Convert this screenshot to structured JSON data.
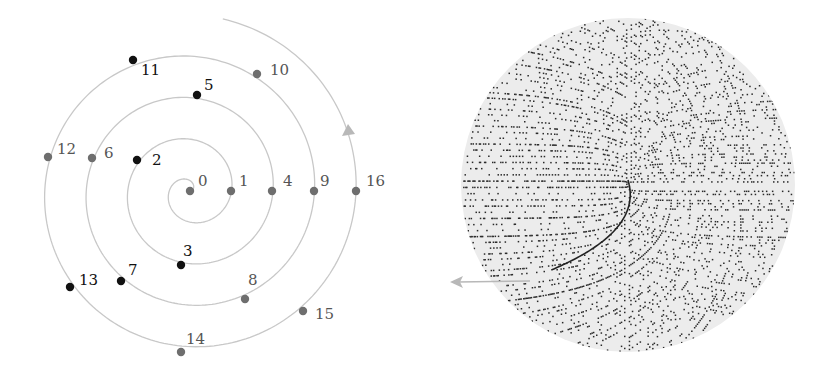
{
  "colors": {
    "background": "#ffffff",
    "spiral_line": "#c8c8c8",
    "prime_dot": "#111111",
    "composite_dot": "#6e6e6e",
    "label": "#333333",
    "arrow": "#b8b8b8",
    "disc_fill": "#ececec",
    "disc_dots": "#2a2a2a"
  },
  "left_panel": {
    "description": "Archimedean spiral with integers 0-16 placed at angle 2π√n, radius ∝ √n; primes shown as black dots",
    "center": [
      190,
      191
    ],
    "unit_radius": 41.5,
    "points": [
      {
        "n": 0,
        "label": "0",
        "prime": false,
        "x": 190,
        "y": 191,
        "lx": 198,
        "ly": 186
      },
      {
        "n": 1,
        "label": "1",
        "prime": false,
        "x": 231,
        "y": 191,
        "lx": 239,
        "ly": 186
      },
      {
        "n": 2,
        "label": "2",
        "prime": true,
        "x": 137,
        "y": 160,
        "lx": 152,
        "ly": 165
      },
      {
        "n": 3,
        "label": "3",
        "prime": true,
        "x": 181,
        "y": 265,
        "lx": 183,
        "ly": 256
      },
      {
        "n": 4,
        "label": "4",
        "prime": false,
        "x": 272,
        "y": 191,
        "lx": 283,
        "ly": 186
      },
      {
        "n": 5,
        "label": "5",
        "prime": true,
        "x": 197,
        "y": 95,
        "lx": 204,
        "ly": 90
      },
      {
        "n": 6,
        "label": "6",
        "prime": false,
        "x": 92,
        "y": 158,
        "lx": 104,
        "ly": 158
      },
      {
        "n": 7,
        "label": "7",
        "prime": true,
        "x": 121,
        "y": 281,
        "lx": 128,
        "ly": 275
      },
      {
        "n": 8,
        "label": "8",
        "prime": false,
        "x": 245,
        "y": 299,
        "lx": 248,
        "ly": 285
      },
      {
        "n": 9,
        "label": "9",
        "prime": false,
        "x": 314,
        "y": 191,
        "lx": 320,
        "ly": 186
      },
      {
        "n": 10,
        "label": "10",
        "prime": false,
        "x": 257,
        "y": 74,
        "lx": 270,
        "ly": 75
      },
      {
        "n": 11,
        "label": "11",
        "prime": true,
        "x": 133,
        "y": 60,
        "lx": 141,
        "ly": 75
      },
      {
        "n": 12,
        "label": "12",
        "prime": false,
        "x": 48,
        "y": 157,
        "lx": 57,
        "ly": 154
      },
      {
        "n": 13,
        "label": "13",
        "prime": true,
        "x": 70,
        "y": 287,
        "lx": 79,
        "ly": 285
      },
      {
        "n": 14,
        "label": "14",
        "prime": false,
        "x": 181,
        "y": 352,
        "lx": 186,
        "ly": 344
      },
      {
        "n": 15,
        "label": "15",
        "prime": false,
        "x": 303,
        "y": 311,
        "lx": 315,
        "ly": 319
      },
      {
        "n": 16,
        "label": "16",
        "prime": false,
        "x": 356,
        "y": 191,
        "lx": 366,
        "ly": 186
      }
    ],
    "arrow": {
      "from": [
        356,
        191
      ],
      "to": [
        348,
        124
      ]
    }
  },
  "right_panel": {
    "description": "Prime number spiral (Sacks spiral) showing many primes as dots inside a gray disc",
    "center": [
      628,
      185
    ],
    "radius": 167,
    "arrow": {
      "from": [
        530,
        281
      ],
      "to": [
        450,
        282
      ]
    }
  }
}
